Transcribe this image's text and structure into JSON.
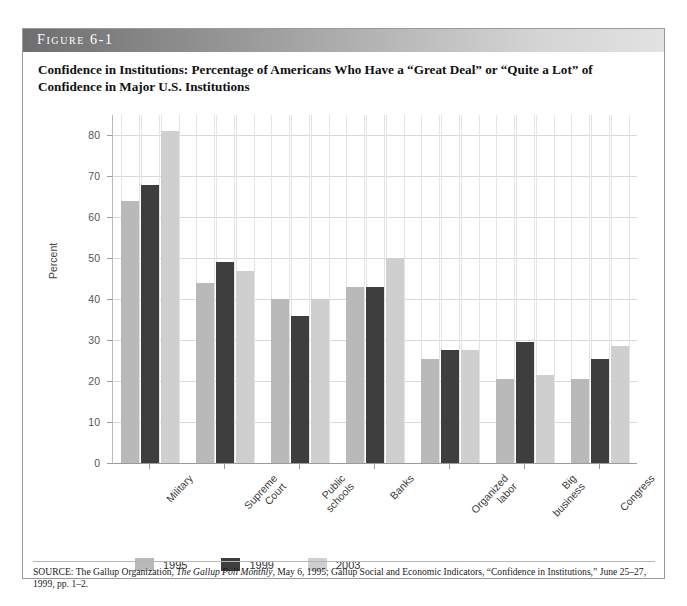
{
  "figure": {
    "band_label": "Figure 6-1",
    "title": "Confidence in Institutions: Percentage of Americans Who Have a “Great Deal” or “Quite a Lot” of Confidence in Major U.S. Institutions",
    "source_prefix": "SOURCE: The Gallup Organization, ",
    "source_italic": "The Gallup Poll Monthly",
    "source_suffix": ", May 6, 1995; Gallup Social and Economic Indicators, “Confidence in Institutions,” June 25–27, 1999, pp. 1–2."
  },
  "chart_data": {
    "type": "bar",
    "title": "Confidence in Institutions: Percentage of Americans Who Have a “Great Deal” or “Quite a Lot” of Confidence in Major U.S. Institutions",
    "xlabel": "",
    "ylabel": "Percent",
    "ylim": [
      0,
      85
    ],
    "yticks": [
      0,
      10,
      20,
      30,
      40,
      50,
      60,
      70,
      80
    ],
    "ytick_labels": [
      "0",
      "10",
      "20",
      "30",
      "40",
      "50",
      "60",
      "70",
      "80"
    ],
    "grid": true,
    "legend_position": "below",
    "categories": [
      "Military",
      "Supreme\nCourt",
      "Public\nschools",
      "Banks",
      "Organized\nlabor",
      "Big\nbusiness",
      "Congress"
    ],
    "series": [
      {
        "name": "1995",
        "color": "#b9b9b9",
        "values": [
          64,
          44,
          40,
          43,
          25.5,
          20.5,
          20.5
        ]
      },
      {
        "name": "1999",
        "color": "#3e3e3e",
        "values": [
          68,
          49,
          36,
          43,
          27.5,
          29.5,
          25.5
        ]
      },
      {
        "name": "2003",
        "color": "#cfcfcf",
        "values": [
          81,
          47,
          40,
          50,
          27.5,
          21.5,
          28.5
        ]
      }
    ]
  },
  "colors": {
    "series_1995": "#b9b9b9",
    "series_1999": "#3e3e3e",
    "series_2003": "#cfcfcf",
    "gridline": "#d9d9d9",
    "axis": "#9b9b9b",
    "frame_border": "#9a9a9a"
  }
}
